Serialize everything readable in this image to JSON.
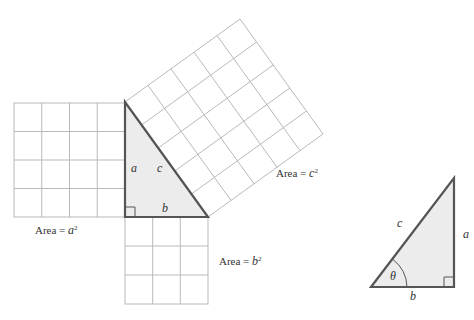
{
  "figure_label": "(a) a",
  "left_figure": {
    "square_a": {
      "grid": 4,
      "label_prefix": "Area = ",
      "label_var": "a",
      "label_exp": "2"
    },
    "square_b": {
      "grid": 3,
      "label_prefix": "Area = ",
      "label_var": "b",
      "label_exp": "2"
    },
    "square_c": {
      "grid": 5,
      "label_prefix": "Area = ",
      "label_var": "c",
      "label_exp": "2"
    },
    "triangle": {
      "side_a": "a",
      "side_b": "b",
      "side_c": "c"
    }
  },
  "right_figure": {
    "triangle": {
      "side_a": "a",
      "side_b": "b",
      "side_c": "c",
      "angle": "θ"
    }
  },
  "colors": {
    "grid": "#b9b9b9",
    "edge": "#555555",
    "fill": "#ececec"
  }
}
